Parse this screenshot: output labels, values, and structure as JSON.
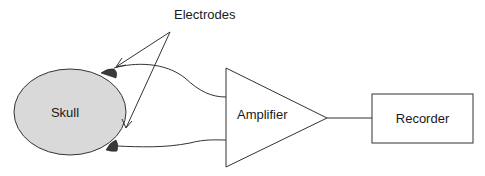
{
  "diagram": {
    "title_label": "Electrodes",
    "nodes": {
      "skull": {
        "label": "Skull",
        "fill": "#d9d9d9",
        "stroke": "#333333"
      },
      "amplifier": {
        "label": "Amplifier",
        "shape": "triangle"
      },
      "recorder": {
        "label": "Recorder",
        "shape": "rectangle"
      }
    },
    "electrodes": [
      {
        "position": "top",
        "color": "#3a3a3a"
      },
      {
        "position": "bottom",
        "color": "#3a3a3a"
      }
    ],
    "edges": [
      {
        "from": "electrode-top",
        "to": "amplifier"
      },
      {
        "from": "electrode-bottom",
        "to": "amplifier"
      },
      {
        "from": "amplifier",
        "to": "recorder"
      }
    ],
    "annotation_arrows": [
      {
        "from": "Electrodes",
        "to": "electrode-top"
      },
      {
        "from": "Electrodes",
        "to": "electrode-bottom"
      }
    ]
  }
}
